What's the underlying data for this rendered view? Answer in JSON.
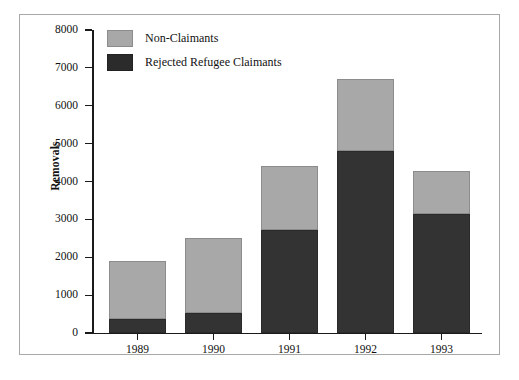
{
  "chart_data": {
    "type": "bar",
    "title": "",
    "subtitle": "",
    "xlabel": "",
    "ylabel": "Removals",
    "categories": [
      "1989",
      "1990",
      "1991",
      "1992",
      "1993"
    ],
    "stacked": true,
    "series": [
      {
        "name": "Rejected Refugee Claimants",
        "color": "#333333",
        "values": [
          380,
          530,
          2720,
          4800,
          3130
        ]
      },
      {
        "name": "Non-Claimants",
        "color": "#a8a8a8",
        "values": [
          1520,
          1970,
          1700,
          1900,
          1150
        ]
      }
    ],
    "totals": [
      1900,
      2500,
      4420,
      6700,
      4280
    ],
    "ylim": [
      0,
      8000
    ],
    "yticks": [
      0,
      1000,
      2000,
      3000,
      4000,
      5000,
      6000,
      7000,
      8000
    ],
    "ytick_labels": [
      "0",
      "1000",
      "2000",
      "3000",
      "4000",
      "5000",
      "6000",
      "7000",
      "8000"
    ],
    "grid": false,
    "legend_position": "top-left",
    "legend_order": [
      "Non-Claimants",
      "Rejected Refugee Claimants"
    ]
  },
  "axes": {
    "y_title": "Removals",
    "y_labels": [
      "8000",
      "7000",
      "6000",
      "5000",
      "4000",
      "3000",
      "2000",
      "1000",
      "0"
    ],
    "x_labels": [
      "1989",
      "1990",
      "1991",
      "1992",
      "1993"
    ]
  },
  "legend": {
    "items": [
      {
        "label": "Non-Claimants",
        "swatch": "gray"
      },
      {
        "label": "Rejected Refugee Claimants",
        "swatch": "dark"
      }
    ]
  },
  "caption": {
    "text": ""
  },
  "colors": {
    "non_claimants": "#a8a8a8",
    "rejected_refugee_claimants": "#333333",
    "frame": "#a8a8a8",
    "axis": "#1a1a1a",
    "background": "#ffffff"
  }
}
